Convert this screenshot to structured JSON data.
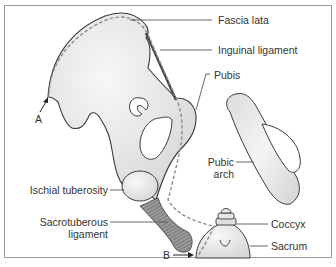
{
  "diagram": {
    "colors": {
      "bone_fill": "#e6e6e6",
      "bone_highlight": "#f7f7f7",
      "outline": "#3a3a3a",
      "dashed_line": "#8c8c8c",
      "ligament": "#7a7a7a",
      "frame": "#9a9a9a",
      "label_text": "#333333"
    },
    "labels": {
      "fascia_lata": "Fascia lata",
      "inguinal_ligament": "Inguinal ligament",
      "pubis": "Pubis",
      "pubic_arch_line1": "Pubic",
      "pubic_arch_line2": "arch",
      "ischial_tuberosity": "Ischial tuberosity",
      "sacrotuberous_line1": "Sacrotuberous",
      "sacrotuberous_line2": "ligament",
      "coccyx": "Coccyx",
      "sacrum": "Sacrum",
      "point_a": "A",
      "point_b": "B"
    }
  }
}
